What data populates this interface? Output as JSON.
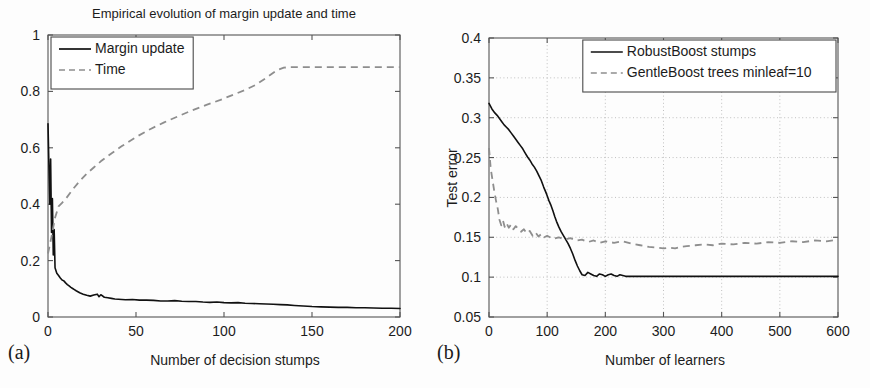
{
  "figure": {
    "panel_a_tag": "(a)",
    "panel_b_tag": "(b)"
  },
  "chart_data": [
    {
      "id": "panel-a",
      "type": "line",
      "title": "Empirical evolution of margin update and time",
      "xlabel": "Number of decision stumps",
      "ylabel": "",
      "xlim": [
        0,
        200
      ],
      "ylim": [
        0,
        1
      ],
      "xticks": [
        0,
        50,
        100,
        150,
        200
      ],
      "xtick_labels": [
        "0",
        "50",
        "100",
        "150",
        "200"
      ],
      "yticks": [
        0,
        0.2,
        0.4,
        0.6,
        0.8,
        1
      ],
      "ytick_labels": [
        "0",
        "0.2",
        "0.4",
        "0.6",
        "0.8",
        "1"
      ],
      "grid": false,
      "legend_position": "upper-left",
      "series": [
        {
          "name": "Margin update",
          "style": "solid",
          "color": "#111111",
          "x": [
            0,
            1,
            1.5,
            2,
            2.5,
            3,
            3.5,
            4,
            5,
            6,
            7,
            8,
            9,
            10,
            11,
            12,
            13,
            14,
            15,
            16,
            18,
            20,
            22,
            24,
            26,
            28,
            29,
            30,
            32,
            34,
            36,
            38,
            40,
            44,
            48,
            52,
            56,
            60,
            64,
            68,
            72,
            76,
            80,
            84,
            88,
            92,
            96,
            100,
            104,
            108,
            112,
            116,
            120,
            124,
            128,
            132,
            136,
            140,
            145,
            150,
            155,
            160,
            165,
            170,
            175,
            180,
            185,
            190,
            195,
            200
          ],
          "y": [
            0.685,
            0.4,
            0.56,
            0.3,
            0.42,
            0.22,
            0.31,
            0.175,
            0.155,
            0.147,
            0.138,
            0.131,
            0.128,
            0.121,
            0.115,
            0.11,
            0.105,
            0.101,
            0.097,
            0.093,
            0.086,
            0.081,
            0.077,
            0.074,
            0.078,
            0.081,
            0.072,
            0.079,
            0.07,
            0.068,
            0.066,
            0.064,
            0.063,
            0.061,
            0.062,
            0.06,
            0.06,
            0.059,
            0.057,
            0.057,
            0.058,
            0.056,
            0.055,
            0.055,
            0.053,
            0.052,
            0.053,
            0.051,
            0.05,
            0.051,
            0.049,
            0.048,
            0.047,
            0.046,
            0.045,
            0.044,
            0.043,
            0.041,
            0.039,
            0.037,
            0.036,
            0.035,
            0.034,
            0.034,
            0.033,
            0.033,
            0.032,
            0.031,
            0.031,
            0.03
          ]
        },
        {
          "name": "Time",
          "style": "dashed",
          "color": "#8e8e8e",
          "x": [
            0,
            2,
            4,
            6,
            8,
            10,
            14,
            18,
            22,
            26,
            30,
            36,
            42,
            50,
            58,
            66,
            74,
            82,
            90,
            98,
            106,
            112,
            118,
            124,
            130,
            134,
            137,
            145,
            160,
            180,
            200
          ],
          "y": [
            0.225,
            0.285,
            0.352,
            0.392,
            0.405,
            0.418,
            0.452,
            0.482,
            0.508,
            0.53,
            0.552,
            0.58,
            0.606,
            0.638,
            0.666,
            0.69,
            0.712,
            0.733,
            0.752,
            0.77,
            0.79,
            0.805,
            0.823,
            0.848,
            0.875,
            0.884,
            0.886,
            0.886,
            0.886,
            0.886,
            0.886
          ]
        }
      ]
    },
    {
      "id": "panel-b",
      "type": "line",
      "title": "",
      "xlabel": "Number of learners",
      "ylabel": "Test error",
      "xlim": [
        0,
        600
      ],
      "ylim": [
        0.05,
        0.4
      ],
      "xticks": [
        0,
        100,
        200,
        300,
        400,
        500,
        600
      ],
      "xtick_labels": [
        "0",
        "100",
        "200",
        "300",
        "400",
        "500",
        "600"
      ],
      "yticks": [
        0.05,
        0.1,
        0.15,
        0.2,
        0.25,
        0.3,
        0.35,
        0.4
      ],
      "ytick_labels": [
        "0.05",
        "0.1",
        "0.15",
        "0.2",
        "0.25",
        "0.3",
        "0.35",
        "0.4"
      ],
      "grid": true,
      "legend_position": "upper-right",
      "series": [
        {
          "name": "RobustBoost stumps",
          "style": "solid",
          "color": "#111111",
          "x": [
            0,
            5,
            10,
            14,
            18,
            22,
            26,
            30,
            34,
            38,
            42,
            46,
            50,
            54,
            58,
            62,
            66,
            70,
            74,
            78,
            82,
            86,
            90,
            94,
            98,
            100,
            103,
            106,
            110,
            113,
            116,
            120,
            124,
            128,
            132,
            136,
            140,
            144,
            148,
            152,
            156,
            160,
            165,
            170,
            175,
            180,
            185,
            190,
            195,
            200,
            205,
            210,
            215,
            220,
            225,
            230,
            235,
            240,
            245,
            250,
            255,
            260,
            300,
            350,
            400,
            450,
            500,
            550,
            600
          ],
          "y": [
            0.318,
            0.311,
            0.306,
            0.303,
            0.299,
            0.295,
            0.291,
            0.288,
            0.285,
            0.281,
            0.277,
            0.273,
            0.269,
            0.265,
            0.261,
            0.256,
            0.251,
            0.247,
            0.242,
            0.238,
            0.233,
            0.227,
            0.221,
            0.213,
            0.206,
            0.202,
            0.196,
            0.191,
            0.183,
            0.176,
            0.17,
            0.163,
            0.157,
            0.152,
            0.147,
            0.142,
            0.136,
            0.129,
            0.121,
            0.114,
            0.108,
            0.103,
            0.102,
            0.106,
            0.104,
            0.102,
            0.101,
            0.104,
            0.103,
            0.101,
            0.103,
            0.104,
            0.102,
            0.101,
            0.103,
            0.102,
            0.101,
            0.101,
            0.101,
            0.101,
            0.101,
            0.101,
            0.101,
            0.101,
            0.101,
            0.101,
            0.101,
            0.101,
            0.101
          ]
        },
        {
          "name": "GentleBoost trees minleaf=10",
          "style": "dashed",
          "color": "#8e8e8e",
          "x": [
            0,
            3,
            6,
            9,
            12,
            15,
            18,
            21,
            24,
            27,
            30,
            34,
            38,
            42,
            46,
            50,
            55,
            60,
            65,
            70,
            75,
            80,
            85,
            90,
            95,
            100,
            110,
            120,
            130,
            140,
            150,
            160,
            170,
            180,
            190,
            200,
            215,
            230,
            245,
            260,
            275,
            290,
            300,
            310,
            320,
            330,
            340,
            355,
            370,
            385,
            400,
            420,
            440,
            460,
            480,
            500,
            520,
            540,
            560,
            580,
            600
          ],
          "y": [
            0.262,
            0.236,
            0.222,
            0.208,
            0.196,
            0.186,
            0.172,
            0.165,
            0.171,
            0.163,
            0.168,
            0.162,
            0.166,
            0.16,
            0.164,
            0.161,
            0.157,
            0.16,
            0.155,
            0.158,
            0.152,
            0.156,
            0.151,
            0.154,
            0.15,
            0.152,
            0.148,
            0.15,
            0.147,
            0.149,
            0.146,
            0.147,
            0.144,
            0.146,
            0.143,
            0.145,
            0.143,
            0.145,
            0.142,
            0.14,
            0.138,
            0.137,
            0.136,
            0.137,
            0.136,
            0.138,
            0.139,
            0.14,
            0.141,
            0.14,
            0.142,
            0.141,
            0.143,
            0.142,
            0.144,
            0.143,
            0.145,
            0.144,
            0.146,
            0.145,
            0.147
          ]
        }
      ]
    }
  ]
}
